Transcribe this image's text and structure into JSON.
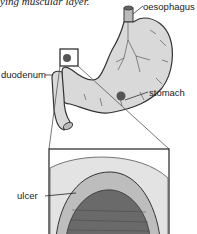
{
  "caption": "ying muscular layer.",
  "labels": {
    "oesophagus": "oesophagus",
    "duodenum": "duodenum",
    "stomach": "stomach",
    "ulcer": "ulcer"
  },
  "colors": {
    "stomach_fill": "#d9d9d9",
    "outline": "#333333",
    "spot": "#555555",
    "ulcer_tissue": "#6a6a6a"
  }
}
